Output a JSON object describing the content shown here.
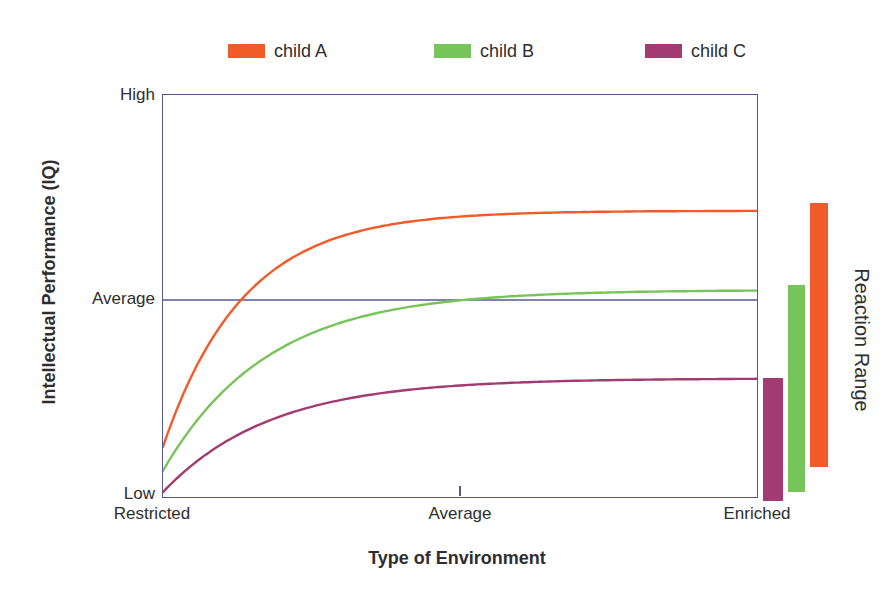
{
  "figure": {
    "y_axis_title": "Intellectual Performance (IQ)",
    "x_axis_title": "Type of Environment",
    "y_tick_high": "High",
    "y_tick_average": "Average",
    "y_tick_low": "Low",
    "x_tick_restricted": "Restricted",
    "x_tick_average": "Average",
    "x_tick_enriched": "Enriched",
    "right_annotation": "Reaction Range"
  },
  "legend": {
    "items": [
      {
        "label": "child A",
        "color": "#F15A29"
      },
      {
        "label": "child B",
        "color": "#77C45B"
      },
      {
        "label": "child C",
        "color": "#A23B71"
      }
    ]
  },
  "colors": {
    "frame": "#585899",
    "text": "#2e2e2e"
  },
  "chart_data": {
    "type": "line",
    "title": "",
    "xlabel": "Type of Environment",
    "ylabel": "Intellectual Performance (IQ)",
    "x_ticks": [
      "Restricted",
      "Average",
      "Enriched"
    ],
    "y_ticks": [
      "High",
      "Average",
      "Low"
    ],
    "axis_note": "qualitative axes; values normalized 0 = Low (bottom), 1 = High (top); x normalized 0 = Restricted, 1 = Enriched",
    "average_level": 0.49,
    "curve_model": "y = plateau + (start - plateau) * exp(-x / tau)",
    "series": [
      {
        "name": "child A",
        "color": "#F15A29",
        "start": 0.125,
        "plateau": 0.712,
        "tau": 0.135,
        "reaction_range": [
          0.072,
          0.728
        ]
      },
      {
        "name": "child B",
        "color": "#77C45B",
        "start": 0.065,
        "plateau": 0.515,
        "tau": 0.175,
        "reaction_range": [
          0.01,
          0.524
        ]
      },
      {
        "name": "child C",
        "color": "#A23B71",
        "start": 0.012,
        "plateau": 0.295,
        "tau": 0.18,
        "reaction_range": [
          -0.012,
          0.294
        ]
      }
    ],
    "annotation": "Reaction Range",
    "legend_position": "top",
    "grid": false
  }
}
